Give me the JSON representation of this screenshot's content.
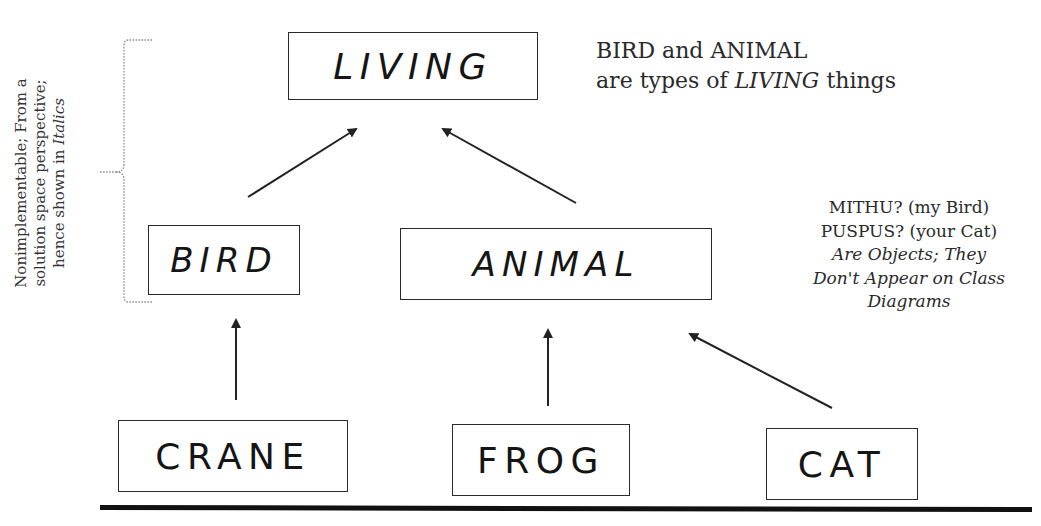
{
  "diagram": {
    "classes": [
      {
        "id": "living",
        "label": "LIVING",
        "italic": true
      },
      {
        "id": "bird",
        "label": "BIRD",
        "italic": true
      },
      {
        "id": "animal",
        "label": "ANIMAL",
        "italic": true
      },
      {
        "id": "crane",
        "label": "CRANE",
        "italic": false
      },
      {
        "id": "frog",
        "label": "FROG",
        "italic": false
      },
      {
        "id": "cat",
        "label": "CAT",
        "italic": false
      }
    ],
    "relationships": [
      {
        "from": "bird",
        "to": "living",
        "type": "inheritance"
      },
      {
        "from": "animal",
        "to": "living",
        "type": "inheritance"
      },
      {
        "from": "crane",
        "to": "bird",
        "type": "inheritance"
      },
      {
        "from": "frog",
        "to": "animal",
        "type": "inheritance"
      },
      {
        "from": "cat",
        "to": "animal",
        "type": "inheritance"
      }
    ]
  },
  "notes": {
    "top_right": {
      "line1": "BIRD and ANIMAL",
      "line2_pre": "are types of ",
      "line2_em": "LIVING",
      "line2_post": " things"
    },
    "objects": {
      "line1": "MITHU? (my Bird)",
      "line2": "PUSPUS? (your Cat)",
      "line3": "Are Objects; They",
      "line4": "Don't Appear on Class",
      "line5": "Diagrams"
    },
    "side": {
      "line1": "Nonimplementable; From a",
      "line2": "solution space perspective;",
      "line3_pre": "hence shown in ",
      "line3_em": "Italics"
    }
  }
}
